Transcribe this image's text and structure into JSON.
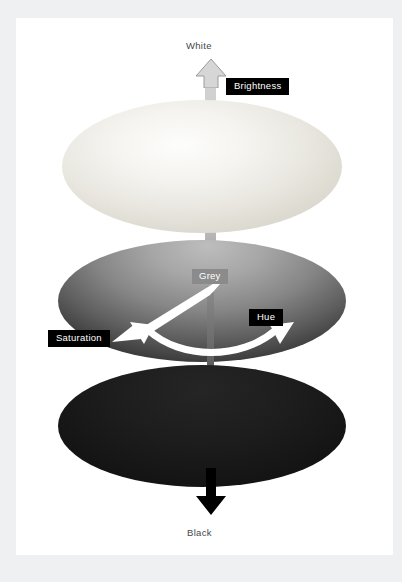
{
  "document": {
    "title": "Colour model diagram",
    "page_background": "#ffffff",
    "canvas_background": "#eef0f1"
  },
  "diagram": {
    "type": "hsb-colour-model",
    "axis_labels": {
      "top": "White",
      "bottom": "Black",
      "centre": "Grey"
    },
    "callouts": [
      {
        "id": "brightness",
        "label": "Brightness",
        "style": "black-badge"
      },
      {
        "id": "saturation",
        "label": "Saturation",
        "style": "black-badge"
      },
      {
        "id": "hue",
        "label": "Hue",
        "style": "black-badge"
      },
      {
        "id": "grey",
        "label": "Grey",
        "style": "grey-badge"
      }
    ],
    "layers": [
      {
        "id": "white-plane",
        "name": "white-ellipse",
        "tone": "#f2f0ea"
      },
      {
        "id": "mid-plane",
        "name": "mid-grey-ellipse",
        "tone": "#8b8b8b"
      },
      {
        "id": "black-plane",
        "name": "black-ellipse",
        "tone": "#141414"
      }
    ],
    "arrows": [
      {
        "id": "brightness-up",
        "name": "up-arrow",
        "colour": "#d2d2d2",
        "direction": "up"
      },
      {
        "id": "brightness-down",
        "name": "down-arrow",
        "colour": "#000000",
        "direction": "down"
      },
      {
        "id": "saturation",
        "name": "diagonal-arrow",
        "colour": "#ffffff",
        "direction": "down-left"
      },
      {
        "id": "hue",
        "name": "curved-arrow",
        "colour": "#ffffff",
        "direction": "bidirectional"
      }
    ],
    "colors": {
      "badge_background": "#000000",
      "badge_text": "#ffffff",
      "grey_badge_background": "#8b8b8b",
      "plain_label_text": "#45484a",
      "arrow_white": "#ffffff",
      "arrow_black": "#000000",
      "arrow_grey": "#d2d2d2"
    }
  }
}
